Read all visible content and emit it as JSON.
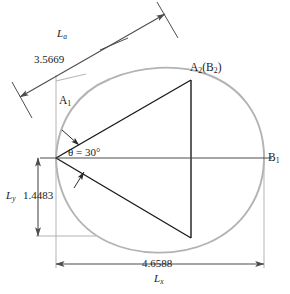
{
  "figure": {
    "type": "engineering-geometry-diagram",
    "colors": {
      "curve": "#b3b3b3",
      "extension_line": "#b3b3b3",
      "triangle": "#1a1a1a",
      "dimension_line": "#4d4d4d",
      "text": "#1a1a1a",
      "background": "#ffffff"
    }
  },
  "labels": {
    "length_a_symbol": "L",
    "length_a_subscript": "a",
    "length_a_value": "3.5669",
    "point_a1": "A",
    "point_a1_subscript": "1",
    "point_a2": "A",
    "point_a2_subscript": "2",
    "point_b2_open": "(B",
    "point_b2_subscript": "2",
    "point_b2_close": ")",
    "point_b1": "B",
    "point_b1_subscript": "1",
    "angle_text": "θ = 30°",
    "length_y_symbol": "L",
    "length_y_subscript": "y",
    "length_y_value": "1.4483",
    "length_x_symbol": "L",
    "length_x_subscript": "x",
    "length_x_value": "4.6588"
  },
  "dimensions": [
    {
      "name": "L_a",
      "label": "3.5669",
      "orientation": "diagonal",
      "symbol": "L",
      "subscript": "a"
    },
    {
      "name": "L_y",
      "label": "1.4483",
      "orientation": "vertical",
      "symbol": "L",
      "subscript": "y"
    },
    {
      "name": "L_x",
      "label": "4.6588",
      "orientation": "horizontal",
      "symbol": "L",
      "subscript": "x"
    }
  ],
  "points": [
    {
      "name": "A1",
      "label": "A₁"
    },
    {
      "name": "A2B2",
      "label": "A₂(B₂)"
    },
    {
      "name": "B1",
      "label": "B₁"
    }
  ],
  "angle": {
    "symbol": "θ",
    "value": "30",
    "unit": "°"
  }
}
